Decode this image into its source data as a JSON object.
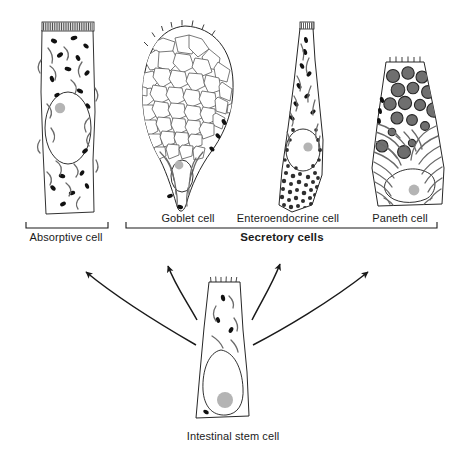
{
  "figure": {
    "ink_color": "#1a1a1a",
    "background_color": "#ffffff",
    "granule_fill": "#6f6f6f",
    "nucleolus_fill": "#b4b4b4"
  },
  "cells": [
    {
      "id": "absorptive-cell",
      "label": "Absorptive cell",
      "label_x": 66,
      "label_y": 236,
      "group": "absorptive",
      "features": [
        "microvilli brush border",
        "oval nucleus",
        "nucleolus",
        "mitochondria"
      ]
    },
    {
      "id": "goblet-cell",
      "label": "Goblet cell",
      "label_x": 188,
      "label_y": 219,
      "group": "secretory",
      "features": [
        "mucin granules",
        "basal nucleus",
        "nucleolus",
        "mitochondria"
      ]
    },
    {
      "id": "enteroendocrine-cell",
      "label": "Enteroendocrine cell",
      "label_x": 288,
      "label_y": 219,
      "group": "secretory",
      "features": [
        "basal secretory granules",
        "nucleus",
        "nucleolus",
        "mitochondria"
      ]
    },
    {
      "id": "paneth-cell",
      "label": "Paneth cell",
      "label_x": 400,
      "label_y": 219,
      "group": "secretory",
      "features": [
        "zymogen granules",
        "rough endoplasmic reticulum",
        "basal nucleus",
        "nucleolus"
      ]
    },
    {
      "id": "intestinal-stem-cell",
      "label": "Intestinal stem cell",
      "label_x": 233,
      "label_y": 437,
      "group": "stem",
      "features": [
        "short microvilli",
        "large basal nucleus",
        "nucleolus",
        "mitochondria"
      ]
    }
  ],
  "brackets": [
    {
      "id": "absorptive-bracket",
      "label": "Absorptive cell",
      "x1": 26,
      "x2": 108,
      "y": 228,
      "bold": false
    },
    {
      "id": "secretory-bracket",
      "label": "Secretory cells",
      "x1": 126,
      "x2": 437,
      "y": 228,
      "bold": true,
      "label_x": 282,
      "label_y": 236
    }
  ],
  "arrows": [
    {
      "id": "arrow-to-absorptive",
      "from": "intestinal-stem-cell",
      "to": "absorptive-cell",
      "direction": "up-left"
    },
    {
      "id": "arrow-to-goblet",
      "from": "intestinal-stem-cell",
      "to": "goblet-cell",
      "direction": "up-left"
    },
    {
      "id": "arrow-to-enteroendocrine",
      "from": "intestinal-stem-cell",
      "to": "enteroendocrine-cell",
      "direction": "up-right"
    },
    {
      "id": "arrow-to-paneth",
      "from": "intestinal-stem-cell",
      "to": "paneth-cell",
      "direction": "up-right"
    }
  ]
}
